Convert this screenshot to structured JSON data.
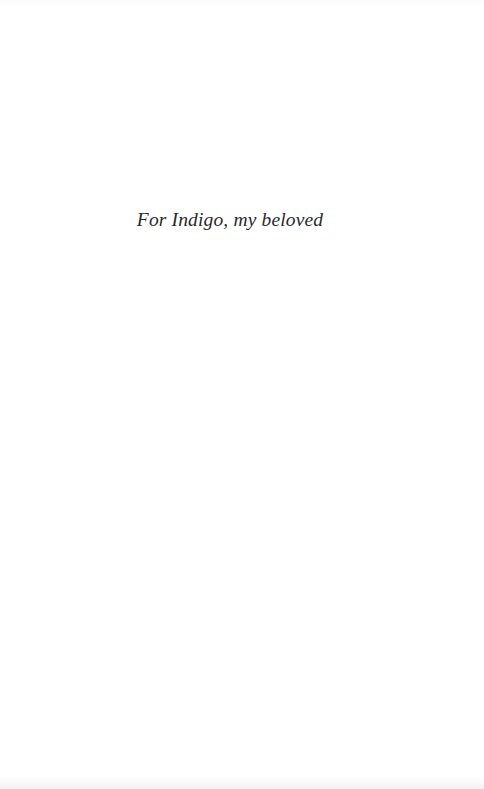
{
  "page": {
    "kind": "book-dedication-page",
    "background_color": "#ffffff",
    "width": 484,
    "height": 789
  },
  "dedication": {
    "text": "For Indigo, my beloved",
    "style": "italic-serif",
    "text_color": "#2b2a2a",
    "alignment": "center"
  }
}
